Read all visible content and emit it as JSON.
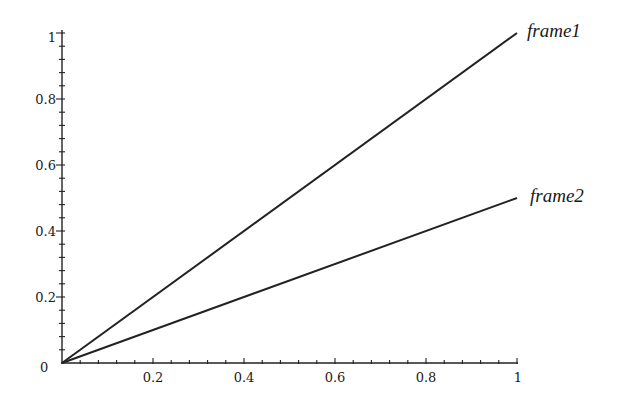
{
  "chart_data": {
    "type": "line",
    "title": "",
    "xlabel": "",
    "ylabel": "",
    "xlim": [
      0,
      1
    ],
    "ylim": [
      0,
      1
    ],
    "grid": false,
    "legend": "inline labels at line ends",
    "x_ticks": [
      "0.2",
      "0.4",
      "0.6",
      "0.8",
      "1"
    ],
    "y_ticks": [
      "0",
      "0.2",
      "0.4",
      "0.6",
      "0.8",
      "1"
    ],
    "series": [
      {
        "name": "frame1",
        "x": [
          0,
          1
        ],
        "y": [
          0,
          1
        ]
      },
      {
        "name": "frame2",
        "x": [
          0,
          1
        ],
        "y": [
          0,
          0.5
        ]
      }
    ]
  },
  "labels": {
    "origin": "0",
    "x_ticks": [
      "0.2",
      "0.4",
      "0.6",
      "0.8",
      "1"
    ],
    "y_ticks": [
      "0.2",
      "0.4",
      "0.6",
      "0.8",
      "1"
    ],
    "series1": "frame1",
    "series2": "frame2"
  }
}
